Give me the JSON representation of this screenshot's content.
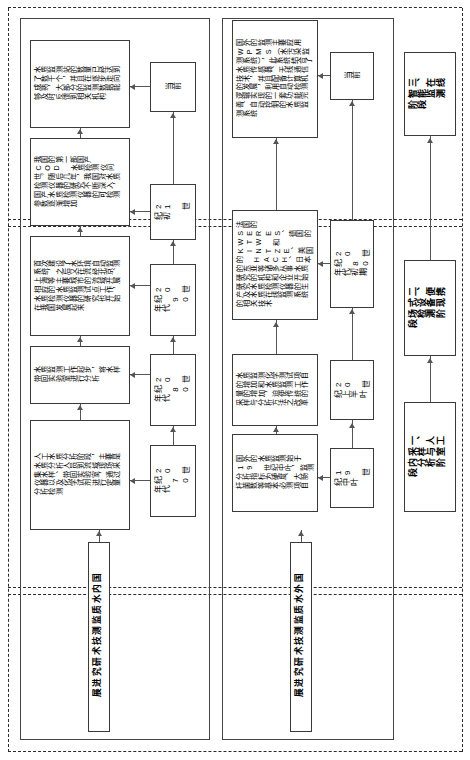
{
  "figure": {
    "orientation": "rotated-90",
    "line_color": "#555555",
    "box_border_color": "#3a3a3a",
    "dashed_color": "#2b2b2b",
    "background": "#ffffff"
  },
  "stage_columns": [
    {
      "id": "stage-1",
      "label": ""
    },
    {
      "id": "stage-2",
      "label": ""
    },
    {
      "id": "stage-3",
      "label": ""
    }
  ],
  "sections": [
    {
      "id": "domestic",
      "title": "国内水质监测技术研究进展",
      "timeline": [
        "20 世纪 70 年代",
        "20 世纪 80 年代",
        "20 世纪 90 年代",
        "21 世纪初",
        "当前"
      ],
      "descriptions": [
        "人工水质分析阶段，主要是水质分析人员到流域现场采集水样、带回实验室，通过仪器以及化学试剂进行定量分析检测",
        "水质监测工作起步，将水样带回实验室进行分析",
        "首次建设了水环境自动监测系统，之后又在流经北京、上海等主要城市的流域开展相应的水质监测试点工作，水质检测仪器的研究也开始在我国发展起来",
        "我国的第一部国产 COD 水质检测仪问世。随后几年，我国对水质检测仪器的研究不断深入，国产水质检测仪器的可检测参数逐渐增加",
        "水质监测站的数量已经达到了数千个，并且在逐步走向成熟，大部分的监测数据能够及时反馈到相关机构"
      ]
    },
    {
      "id": "overseas",
      "title": "国外水质监测技术研究进展",
      "timeline": [
        "19 世纪中叶",
        "20 世纪上半叶",
        "20 世纪 80 年代初期",
        "当前"
      ],
      "descriptions": [
        "国外的水质监测始于 19 世纪中叶，监测分析指标为硬度、大肠杆菌数等基本必测项目",
        "水质监测化学测试项目的增加和水质监测工作量的增加，迫使传统的采样与分析方法之改革",
        "法国的 SERES、德国的 WTW 和 KINTZE、美国的 HACH、日本的东亚等诸多从事水质研究的机构和企业开始研究水质检测仪器的生产及水质在线监测系统的相关技术",
        "国外的监测主要应用 WPMS（水污染监测系统），此系统结合了水质传感器、无线通信技术，并且配备计算机的发展，利用自动检测逻辑实现的一套功能完善、自动控制的水质监测系统"
      ]
    },
    {
      "id": "stages",
      "title": "",
      "timeline": [],
      "descriptions": [
        "一、人工采样与室内分析阶段",
        "二、便携式设备现场检测阶段",
        "三、在线智能监测阶段"
      ]
    }
  ]
}
